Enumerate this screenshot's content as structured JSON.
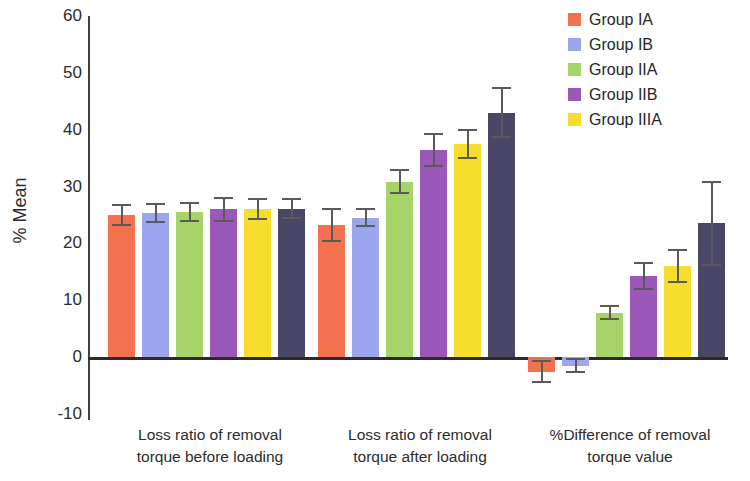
{
  "chart_data": {
    "type": "bar",
    "title": "",
    "xlabel": "",
    "ylabel": "% Mean",
    "ylim": [
      -10,
      60
    ],
    "ytick_values": [
      60,
      50,
      40,
      30,
      20,
      10,
      0,
      -10
    ],
    "ytick_labels": [
      "60",
      "50",
      "40",
      "30",
      "20",
      "10",
      "0",
      "-10"
    ],
    "grid": false,
    "legend_position": "top-right",
    "error_bars": "visible",
    "categories": [
      "Loss ratio of removal torque before loading",
      "Loss ratio of removal torque after loading",
      "%Difference of removal torque value"
    ],
    "category_lines": [
      [
        "Loss ratio of removal",
        "torque before loading"
      ],
      [
        "Loss ratio of removal",
        "torque after loading"
      ],
      [
        "%Difference of removal",
        "torque value"
      ]
    ],
    "series": [
      {
        "name": "Group IA",
        "color": "#F4714F",
        "in_legend": true,
        "values": [
          25.0,
          23.2,
          -2.6
        ],
        "errors": [
          2.0,
          3.0,
          2.0
        ]
      },
      {
        "name": "Group IB",
        "color": "#9BA6EE",
        "in_legend": true,
        "values": [
          25.3,
          24.5,
          -1.5
        ],
        "errors": [
          1.8,
          1.7,
          1.3
        ]
      },
      {
        "name": "Group IIA",
        "color": "#A6D468",
        "in_legend": true,
        "values": [
          25.5,
          30.8,
          7.8
        ],
        "errors": [
          1.7,
          2.2,
          1.3
        ]
      },
      {
        "name": "Group IIB",
        "color": "#9B58B8",
        "in_legend": true,
        "values": [
          26.0,
          36.4,
          14.3
        ],
        "errors": [
          2.2,
          3.0,
          2.5
        ]
      },
      {
        "name": "Group IIIA",
        "color": "#F7DE2E",
        "in_legend": true,
        "values": [
          26.0,
          37.5,
          16.0
        ],
        "errors": [
          1.9,
          2.6,
          3.0
        ]
      },
      {
        "name": "",
        "color": "#4A4766",
        "in_legend": false,
        "values": [
          26.1,
          43.0,
          23.5
        ],
        "errors": [
          1.9,
          4.5,
          7.5
        ]
      }
    ]
  },
  "legend": {
    "items": [
      {
        "label": "Group IA",
        "color": "#F4714F"
      },
      {
        "label": "Group IB",
        "color": "#9BA6EE"
      },
      {
        "label": "Group IIA",
        "color": "#A6D468"
      },
      {
        "label": "Group IIB",
        "color": "#9B58B8"
      },
      {
        "label": "Group IIIA",
        "color": "#F7DE2E"
      }
    ]
  },
  "axis": {
    "y_title": "% Mean",
    "y_ticks": [
      "60",
      "50",
      "40",
      "30",
      "20",
      "10",
      "0",
      "-10"
    ]
  }
}
